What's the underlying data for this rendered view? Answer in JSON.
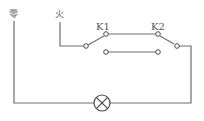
{
  "diagram": {
    "type": "circuit",
    "title": "",
    "labels": {
      "neutral": "零",
      "live": "火",
      "switch1": "K1",
      "switch2": "K2"
    },
    "components": [
      {
        "id": "neutral-wire",
        "kind": "wire",
        "label": "零"
      },
      {
        "id": "live-wire",
        "kind": "wire",
        "label": "火"
      },
      {
        "id": "K1",
        "kind": "single-pole-double-throw switch",
        "label": "K1"
      },
      {
        "id": "K2",
        "kind": "single-pole-double-throw switch",
        "label": "K2"
      },
      {
        "id": "lamp",
        "kind": "lamp",
        "symbol": "circle-with-x"
      }
    ],
    "connections": [
      {
        "from": "live-wire",
        "to": "K1.common"
      },
      {
        "from": "K1.upper",
        "to": "K2.upper"
      },
      {
        "from": "K1.lower",
        "to": "K2.lower"
      },
      {
        "from": "K2.common",
        "to": "lamp"
      },
      {
        "from": "lamp",
        "to": "neutral-wire"
      }
    ],
    "colors": {
      "wire": "#6e6e6e",
      "text": "#555555",
      "background": "#ffffff"
    }
  }
}
